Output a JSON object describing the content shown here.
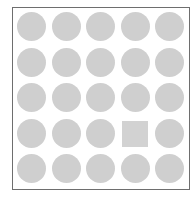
{
  "puzzle": {
    "rows": 5,
    "cols": 5,
    "default_shape": "circle",
    "shape_color": "#cfcfcf",
    "border_color": "#6e6e6e",
    "odd_one_out": {
      "row": 4,
      "col": 4,
      "shape": "square"
    },
    "cells": [
      [
        "circle",
        "circle",
        "circle",
        "circle",
        "circle"
      ],
      [
        "circle",
        "circle",
        "circle",
        "circle",
        "circle"
      ],
      [
        "circle",
        "circle",
        "circle",
        "circle",
        "circle"
      ],
      [
        "circle",
        "circle",
        "circle",
        "square",
        "circle"
      ],
      [
        "circle",
        "circle",
        "circle",
        "circle",
        "circle"
      ]
    ]
  }
}
